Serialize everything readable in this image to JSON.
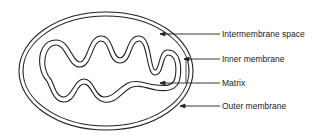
{
  "diagram": {
    "labels": [
      {
        "id": "intermembrane-space",
        "text": "Intermembrane space",
        "y": 34
      },
      {
        "id": "inner-membrane",
        "text": "Inner membrane",
        "y": 59
      },
      {
        "id": "matrix",
        "text": "Matrix",
        "y": 83
      },
      {
        "id": "outer-membrane",
        "text": "Outer membrane",
        "y": 106
      }
    ],
    "colors": {
      "stroke": "#222222",
      "background": "#ffffff"
    }
  }
}
